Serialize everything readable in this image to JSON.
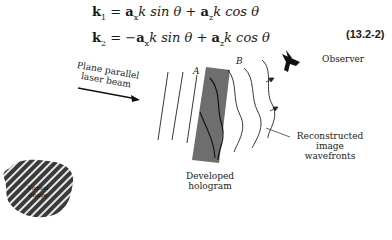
{
  "equations": {
    "k1": {
      "lhs": "k",
      "lhs_sub": "1",
      "rhs": [
        "= ",
        "a",
        "x",
        "k sin θ + ",
        "a",
        "z",
        "k cos θ"
      ]
    },
    "k2": {
      "lhs": "k",
      "lhs_sub": "2",
      "rhs": [
        "= −",
        "a",
        "x",
        "k sin θ + ",
        "a",
        "z",
        "k cos θ"
      ]
    },
    "number": "(13.2-2)"
  },
  "diagram": {
    "beam_label_line1": "Plane parallel",
    "beam_label_line2": "laser beam",
    "label_A": "A",
    "label_B": "B",
    "observer_label": "Observer",
    "wavefronts_label_line1": "Reconstructed",
    "wavefronts_label_line2": "image",
    "wavefronts_label_line3": "wavefronts",
    "hologram_label_line1": "Developed",
    "hologram_label_line2": "hologram",
    "virtual_label_line1": "Virtual",
    "virtual_label_line2": "image",
    "hologram_color": "#6e6e6e"
  }
}
